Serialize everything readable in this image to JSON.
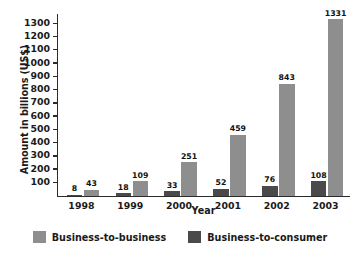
{
  "chart_data": {
    "type": "bar",
    "title": "",
    "subtitle": "",
    "xlabel": "Year",
    "ylabel": "Amount in billions (US$)",
    "categories": [
      "1998",
      "1999",
      "2000",
      "2001",
      "2002",
      "2003"
    ],
    "series": [
      {
        "name": "Business-to-consumer",
        "color": "#4a4a4a",
        "values": [
          8,
          18,
          33,
          52,
          76,
          108
        ]
      },
      {
        "name": "Business-to-business",
        "color": "#8e8e8e",
        "values": [
          43,
          109,
          251,
          459,
          843,
          1331
        ]
      }
    ],
    "ylim": [
      0,
      1370
    ],
    "yticks": [
      100,
      200,
      300,
      400,
      500,
      600,
      700,
      800,
      900,
      1000,
      1100,
      1200,
      1300
    ],
    "ytick_labels": [
      "100",
      "200",
      "300",
      "400",
      "500",
      "600",
      "700",
      "800",
      "900",
      "1000",
      "1100",
      "1200",
      "1300"
    ],
    "grid": false,
    "data_labels": true,
    "legend_position": "bottom",
    "bar_order_in_group": [
      "Business-to-consumer",
      "Business-to-business"
    ],
    "spines": [
      "left",
      "bottom"
    ]
  },
  "legend": {
    "entries": [
      {
        "label": "Business-to-business",
        "color": "#8e8e8e"
      },
      {
        "label": "Business-to-consumer",
        "color": "#4a4a4a"
      }
    ]
  }
}
